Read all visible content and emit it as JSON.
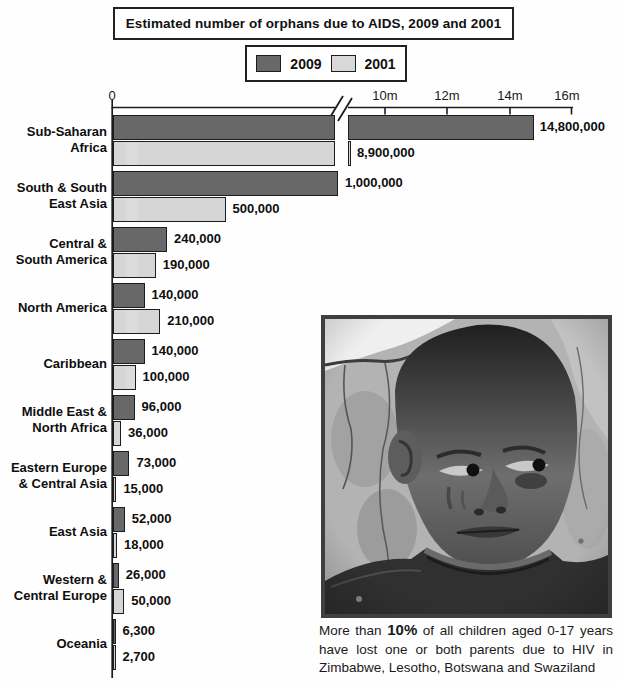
{
  "title": "Estimated number of orphans due to AIDS, 2009 and 2001",
  "legend": {
    "items": [
      {
        "label": "2009",
        "color": "#686868"
      },
      {
        "label": "2001",
        "color": "#d8d8d8"
      }
    ]
  },
  "axis": {
    "tick_labels": [
      "0",
      "10m",
      "12m",
      "14m",
      "16m"
    ],
    "broken": true
  },
  "chart_data": {
    "type": "bar",
    "orientation": "horizontal",
    "title": "Estimated number of orphans due to AIDS, 2009 and 2001",
    "x_axis": {
      "tick_labels": [
        "0",
        "10m",
        "12m",
        "14m",
        "16m"
      ],
      "tick_values": [
        0,
        10000000,
        12000000,
        14000000,
        16000000
      ],
      "broken_axis": true,
      "break_between_values": [
        1100000,
        8600000
      ]
    },
    "legend_position": "top",
    "categories": [
      "Sub-Saharan Africa",
      "South & South East Asia",
      "Central & South America",
      "North America",
      "Caribbean",
      "Middle East & North Africa",
      "Eastern Europe & Central Asia",
      "East Asia",
      "Western & Central Europe",
      "Oceania"
    ],
    "categories_display": [
      [
        "Sub-Saharan",
        "Africa"
      ],
      [
        "South & South",
        "East Asia"
      ],
      [
        "Central &",
        "South America"
      ],
      [
        "North America"
      ],
      [
        "Caribbean"
      ],
      [
        "Middle East &",
        "North Africa"
      ],
      [
        "Eastern Europe",
        "& Central Asia"
      ],
      [
        "East Asia"
      ],
      [
        "Western &",
        "Central Europe"
      ],
      [
        "Oceania"
      ]
    ],
    "series": [
      {
        "name": "2009",
        "color": "#686868",
        "values": [
          14800000,
          1000000,
          240000,
          140000,
          140000,
          96000,
          73000,
          52000,
          26000,
          6300
        ],
        "value_labels": [
          "14,800,000",
          "1,000,000",
          "240,000",
          "140,000",
          "140,000",
          "96,000",
          "73,000",
          "52,000",
          "26,000",
          "6,300"
        ]
      },
      {
        "name": "2001",
        "color": "#d8d8d8",
        "values": [
          8900000,
          500000,
          190000,
          210000,
          100000,
          36000,
          15000,
          18000,
          50000,
          2700
        ],
        "value_labels": [
          "8,900,000",
          "500,000",
          "190,000",
          "210,000",
          "100,000",
          "36,000",
          "15,000",
          "18,000",
          "50,000",
          "2,700"
        ]
      }
    ]
  },
  "photo_caption": {
    "prefix": "More than ",
    "highlight": "10%",
    "suffix": " of all children aged 0-17 years have lost one or both parents due to HIV in Zimbabwe, Lesotho, Botswana and Swaziland"
  }
}
